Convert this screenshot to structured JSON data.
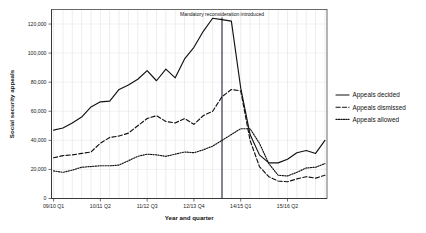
{
  "chart_data": {
    "type": "line",
    "title": "",
    "xlabel": "Year and quarter",
    "ylabel": "Social security appeals",
    "ylim": [
      0,
      130000
    ],
    "yticks": [
      0,
      20000,
      40000,
      60000,
      80000,
      100000,
      120000
    ],
    "ytick_labels": [
      "0",
      "20,000",
      "40,000",
      "60,000",
      "80,000",
      "100,000",
      "120,000"
    ],
    "grid": true,
    "legend_position": "right",
    "x": [
      "09/10 Q1",
      "09/10 Q2",
      "09/10 Q3",
      "09/10 Q4",
      "10/11 Q1",
      "10/11 Q2",
      "10/11 Q3",
      "10/11 Q4",
      "11/12 Q1",
      "11/12 Q2",
      "11/12 Q3",
      "11/12 Q4",
      "12/13 Q1",
      "12/13 Q2",
      "12/13 Q3",
      "12/13 Q4",
      "13/14 Q1",
      "13/14 Q2",
      "13/14 Q3",
      "13/14 Q4",
      "14/15 Q1",
      "14/15 Q2",
      "14/15 Q3",
      "14/15 Q4",
      "15/16 Q1",
      "15/16 Q2",
      "15/16 Q3",
      "15/16 Q4",
      "16/17 Q1",
      "16/17 Q2"
    ],
    "xtick_labels": [
      "09/10 Q1",
      "10/11 Q2",
      "11/12 Q3",
      "12/13 Q4",
      "14/15 Q1",
      "15/16 Q2"
    ],
    "xtick_indices": [
      0,
      5,
      10,
      15,
      20,
      25
    ],
    "series": [
      {
        "name": "Appeals decided",
        "style": "solid",
        "values": [
          47000,
          48500,
          52000,
          56000,
          63000,
          66500,
          67000,
          75000,
          78000,
          82000,
          88000,
          81000,
          89000,
          83000,
          96000,
          104000,
          115000,
          124000,
          123000,
          122000,
          76000,
          44000,
          30000,
          24500,
          24500,
          27000,
          31500,
          33000,
          31000,
          40000
        ]
      },
      {
        "name": "Appeals dismissed",
        "style": "dashed",
        "values": [
          28000,
          29500,
          30000,
          31000,
          32000,
          38000,
          42000,
          43000,
          45000,
          50000,
          55000,
          57000,
          53000,
          52000,
          55000,
          51000,
          57000,
          60000,
          70000,
          75000,
          74000,
          40000,
          22000,
          15000,
          12000,
          11500,
          13500,
          15000,
          14000,
          16000
        ]
      },
      {
        "name": "Appeals allowed",
        "style": "dotted",
        "values": [
          19000,
          18000,
          19500,
          21500,
          22000,
          22500,
          22500,
          23000,
          26000,
          29000,
          30500,
          30000,
          29000,
          30500,
          32000,
          31500,
          33500,
          36000,
          40000,
          44000,
          48000,
          48000,
          38000,
          24000,
          16000,
          15500,
          18000,
          21000,
          21500,
          24000
        ]
      }
    ],
    "annotations": [
      {
        "text": "Mandatory reconsideration introduced",
        "at_index": 18,
        "type": "vertical-line"
      }
    ]
  },
  "legend": {
    "items": [
      {
        "label": "Appeals decided",
        "style": "solid"
      },
      {
        "label": "Appeals dismissed",
        "style": "dashed"
      },
      {
        "label": "Appeals allowed",
        "style": "dotted"
      }
    ]
  }
}
